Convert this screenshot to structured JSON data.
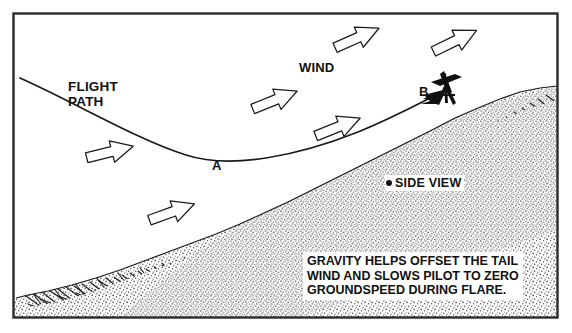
{
  "figure": {
    "border_color": "#2b2b2b",
    "ink_color": "#111111",
    "background": "#ffffff"
  },
  "labels": {
    "flight_path_line1": "FLIGHT",
    "flight_path_line2": "PATH",
    "wind": "WIND",
    "point_a": "A",
    "point_b": "B",
    "side_view": "SIDE VIEW"
  },
  "caption": {
    "line1": "GRAVITY HELPS OFFSET THE TAIL",
    "line2": "WIND AND SLOWS PILOT TO ZERO",
    "line3": "GROUNDSPEED DURING FLARE."
  },
  "icons": {
    "wind_arrow": "block-arrow-right",
    "flight_arrowhead": "solid-arrowhead",
    "side_view_bullet": "filled-dot",
    "glider": "hang-glider-pilot-silhouette"
  },
  "wind_arrows": [
    {
      "name": "wind-arrow-1",
      "x": 110,
      "y": 152,
      "angle": -14
    },
    {
      "name": "wind-arrow-2",
      "x": 172,
      "y": 212,
      "angle": -20
    },
    {
      "name": "wind-arrow-3",
      "x": 275,
      "y": 100,
      "angle": -22
    },
    {
      "name": "wind-arrow-4",
      "x": 338,
      "y": 127,
      "angle": -22
    },
    {
      "name": "wind-arrow-5",
      "x": 357,
      "y": 38,
      "angle": -24
    },
    {
      "name": "wind-arrow-6",
      "x": 455,
      "y": 41,
      "angle": -26
    }
  ],
  "terrain": {
    "description": "rising slope from lower-left to upper-right with hatched ridge band and stippled ground"
  }
}
